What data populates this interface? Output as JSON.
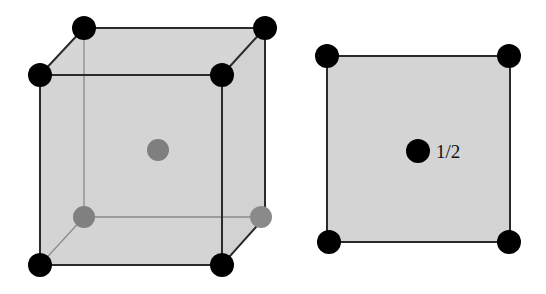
{
  "diagram": {
    "cube": {
      "name": "bcc-unit-cell-3d",
      "corner_atoms_front": 4,
      "corner_atoms_back_top": 2,
      "corner_atoms_back_bottom_hidden": 2,
      "body_center_atom": "hidden (gray)"
    },
    "plan_view": {
      "name": "bcc-plan-view",
      "corner_atoms": 4,
      "center_atom_label": "1/2"
    },
    "colors": {
      "face_fill": "#d4d4d4",
      "edge": "#2a2a2a",
      "hidden_edge": "#8a8a8a",
      "atom": "#000000",
      "hidden_atom": "#808080"
    }
  }
}
